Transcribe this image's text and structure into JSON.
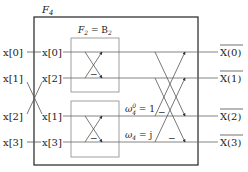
{
  "diagram": {
    "outer_block_label": "F",
    "outer_block_sub": "4",
    "inner_block_label": "F",
    "inner_block_sub": "2",
    "inner_block_eq": " = B",
    "inner_block_eq_sub": "2",
    "inputs": [
      "x[0]",
      "x[1]",
      "x[2]",
      "x[3]"
    ],
    "permuted_inputs": [
      "x[0]",
      "x[2]",
      "x[1]",
      "x[3]"
    ],
    "outputs": [
      "X(0)",
      "X(1)",
      "X(2)",
      "X(3)"
    ],
    "output_marker": "bar",
    "twiddles": [
      {
        "label": "ω",
        "sup": "0",
        "sub": "4",
        "rhs": " = 1"
      },
      {
        "label": "ω",
        "sub": "4",
        "rhs": " = j"
      }
    ],
    "minus_sign": "−",
    "colors": {
      "box_outer": "#333333",
      "box_inner": "#888888",
      "line": "#555555"
    }
  }
}
